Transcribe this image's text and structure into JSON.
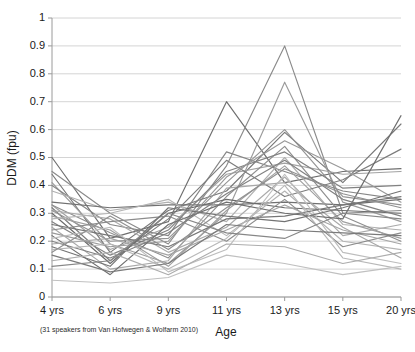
{
  "figure": {
    "caption_note": "(31 speakers from Van Hofwegen & Wolfarm 2010)",
    "background_color": "#ffffff",
    "line_color_base": "#808080",
    "grid_color": "#c9c9c9",
    "axis_color": "#9a9a9a"
  },
  "chart_data": {
    "type": "line",
    "title": "",
    "subtitle": "",
    "xlabel": "Age",
    "ylabel": "DDM (fpu)",
    "categories": [
      "4 yrs",
      "6 yrs",
      "9 yrs",
      "11 yrs",
      "13 yrs",
      "15 yrs",
      "20 yrs"
    ],
    "x_tick_labels": [
      "4 yrs",
      "6 yrs",
      "9 yrs",
      "11 yrs",
      "13 yrs",
      "15 yrs",
      "20 yrs"
    ],
    "y_tick_labels": [
      "0",
      "0.1",
      "0.2",
      "0.3",
      "0.4",
      "0.5",
      "0.6",
      "0.7",
      "0.8",
      "0.9",
      "1"
    ],
    "y_tick_values": [
      0,
      0.1,
      0.2,
      0.3,
      0.4,
      0.5,
      0.6,
      0.7,
      0.8,
      0.9,
      1
    ],
    "ylim": [
      0,
      1
    ],
    "xlim": [
      0,
      6
    ],
    "grid": "horizontal",
    "legend": "none",
    "n_series": 31,
    "annotation": "(31 speakers from Van Hofwegen & Wolfarm 2010)",
    "series": [
      {
        "name": "speaker-01",
        "shade": "#6e6e6e",
        "values": [
          0.5,
          0.21,
          0.27,
          0.7,
          0.41,
          0.45,
          0.46
        ]
      },
      {
        "name": "speaker-02",
        "shade": "#8a8a8a",
        "values": [
          0.45,
          0.3,
          0.19,
          0.47,
          0.9,
          0.3,
          0.31
        ]
      },
      {
        "name": "speaker-03",
        "shade": "#777777",
        "values": [
          0.44,
          0.16,
          0.31,
          0.38,
          0.59,
          0.41,
          0.62
        ]
      },
      {
        "name": "speaker-04",
        "shade": "#9b9b9b",
        "values": [
          0.41,
          0.19,
          0.12,
          0.3,
          0.77,
          0.34,
          0.27
        ]
      },
      {
        "name": "speaker-05",
        "shade": "#868686",
        "values": [
          0.4,
          0.26,
          0.22,
          0.52,
          0.45,
          0.38,
          0.35
        ]
      },
      {
        "name": "speaker-06",
        "shade": "#b0b0b0",
        "values": [
          0.38,
          0.31,
          0.34,
          0.27,
          0.5,
          0.26,
          0.24
        ]
      },
      {
        "name": "speaker-07",
        "shade": "#707070",
        "values": [
          0.34,
          0.32,
          0.33,
          0.33,
          0.34,
          0.33,
          0.35
        ]
      },
      {
        "name": "speaker-08",
        "shade": "#a2a2a2",
        "values": [
          0.33,
          0.17,
          0.25,
          0.44,
          0.48,
          0.44,
          0.45
        ]
      },
      {
        "name": "speaker-09",
        "shade": "#8e8e8e",
        "values": [
          0.33,
          0.23,
          0.14,
          0.36,
          0.54,
          0.29,
          0.2
        ]
      },
      {
        "name": "speaker-10",
        "shade": "#7c7c7c",
        "values": [
          0.32,
          0.13,
          0.28,
          0.49,
          0.36,
          0.42,
          0.53
        ]
      },
      {
        "name": "speaker-11",
        "shade": "#ababab",
        "values": [
          0.31,
          0.28,
          0.16,
          0.25,
          0.43,
          0.22,
          0.26
        ]
      },
      {
        "name": "speaker-12",
        "shade": "#949494",
        "values": [
          0.31,
          0.2,
          0.21,
          0.41,
          0.6,
          0.36,
          0.33
        ]
      },
      {
        "name": "speaker-13",
        "shade": "#6a6a6a",
        "values": [
          0.3,
          0.12,
          0.3,
          0.35,
          0.32,
          0.31,
          0.3
        ]
      },
      {
        "name": "speaker-14",
        "shade": "#9f9f9f",
        "values": [
          0.29,
          0.24,
          0.11,
          0.31,
          0.47,
          0.27,
          0.21
        ]
      },
      {
        "name": "speaker-15",
        "shade": "#b5b5b5",
        "values": [
          0.28,
          0.3,
          0.35,
          0.22,
          0.38,
          0.2,
          0.17
        ]
      },
      {
        "name": "speaker-16",
        "shade": "#828282",
        "values": [
          0.27,
          0.15,
          0.24,
          0.45,
          0.52,
          0.39,
          0.4
        ]
      },
      {
        "name": "speaker-17",
        "shade": "#767676",
        "values": [
          0.26,
          0.22,
          0.18,
          0.28,
          0.29,
          0.33,
          0.36
        ]
      },
      {
        "name": "speaker-18",
        "shade": "#a8a8a8",
        "values": [
          0.25,
          0.1,
          0.13,
          0.39,
          0.41,
          0.25,
          0.14
        ]
      },
      {
        "name": "speaker-19",
        "shade": "#8c8c8c",
        "values": [
          0.24,
          0.27,
          0.29,
          0.2,
          0.35,
          0.18,
          0.23
        ]
      },
      {
        "name": "speaker-20",
        "shade": "#999999",
        "values": [
          0.23,
          0.18,
          0.2,
          0.43,
          0.56,
          0.46,
          0.34
        ]
      },
      {
        "name": "speaker-21",
        "shade": "#6f6f6f",
        "values": [
          0.22,
          0.08,
          0.26,
          0.34,
          0.3,
          0.28,
          0.65
        ]
      },
      {
        "name": "speaker-22",
        "shade": "#bdbdbd",
        "values": [
          0.21,
          0.25,
          0.09,
          0.17,
          0.44,
          0.16,
          0.12
        ]
      },
      {
        "name": "speaker-23",
        "shade": "#818181",
        "values": [
          0.2,
          0.14,
          0.23,
          0.37,
          0.49,
          0.35,
          0.29
        ]
      },
      {
        "name": "speaker-24",
        "shade": "#a5a5a5",
        "values": [
          0.19,
          0.21,
          0.15,
          0.24,
          0.33,
          0.24,
          0.19
        ]
      },
      {
        "name": "speaker-25",
        "shade": "#737373",
        "values": [
          0.18,
          0.11,
          0.32,
          0.29,
          0.27,
          0.32,
          0.38
        ]
      },
      {
        "name": "speaker-26",
        "shade": "#b8b8b8",
        "values": [
          0.17,
          0.19,
          0.1,
          0.21,
          0.4,
          0.14,
          0.1
        ]
      },
      {
        "name": "speaker-27",
        "shade": "#909090",
        "values": [
          0.16,
          0.29,
          0.17,
          0.32,
          0.46,
          0.37,
          0.32
        ]
      },
      {
        "name": "speaker-28",
        "shade": "#7a7a7a",
        "values": [
          0.15,
          0.09,
          0.12,
          0.26,
          0.24,
          0.23,
          0.22
        ]
      },
      {
        "name": "speaker-29",
        "shade": "#adadad",
        "values": [
          0.13,
          0.16,
          0.08,
          0.19,
          0.18,
          0.12,
          0.16
        ]
      },
      {
        "name": "speaker-30",
        "shade": "#878787",
        "values": [
          0.11,
          0.13,
          0.3,
          0.23,
          0.21,
          0.3,
          0.28
        ]
      },
      {
        "name": "speaker-31",
        "shade": "#c0c0c0",
        "values": [
          0.06,
          0.05,
          0.07,
          0.15,
          0.12,
          0.08,
          0.11
        ]
      }
    ]
  }
}
